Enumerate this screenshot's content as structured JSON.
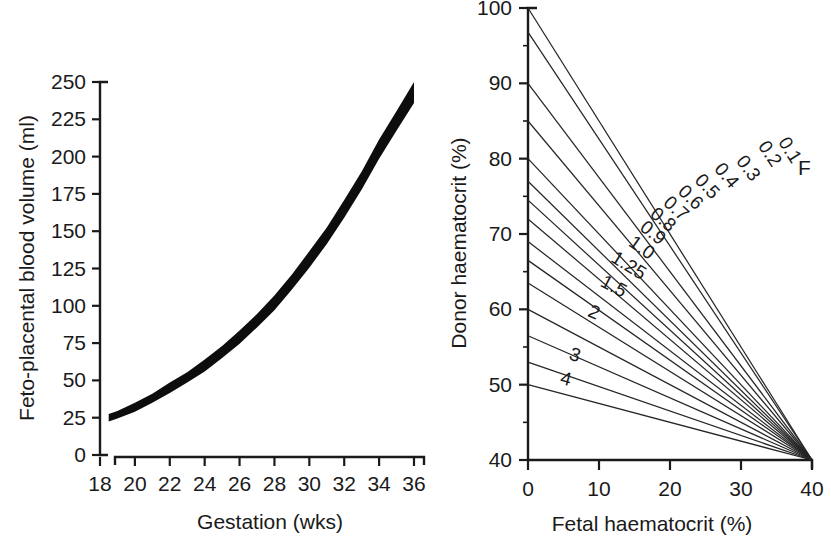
{
  "figure": {
    "background_color": "#ffffff",
    "ink_color": "#1a1a1a",
    "panel_count": 2
  },
  "chart_data": [
    {
      "id": "feto-placental-blood-volume",
      "type": "line",
      "title": "",
      "xlabel": "Gestation (wks)",
      "ylabel": "Feto-placental blood volume (ml)",
      "xlim": [
        18,
        36
      ],
      "ylim": [
        0,
        250
      ],
      "xticks": [
        18,
        20,
        22,
        24,
        26,
        28,
        30,
        32,
        34,
        36
      ],
      "yticks": [
        0,
        25,
        50,
        75,
        100,
        125,
        150,
        175,
        200,
        225,
        250
      ],
      "xtick_labels": [
        "18",
        "20",
        "22",
        "24",
        "26",
        "28",
        "30",
        "32",
        "34",
        "36"
      ],
      "ytick_labels": [
        "0",
        "25",
        "50",
        "75",
        "100",
        "125",
        "150",
        "175",
        "200",
        "225",
        "250"
      ],
      "grid": false,
      "legend": false,
      "series": [
        {
          "name": "Feto-placental blood volume",
          "style": "thick-band",
          "x": [
            18.5,
            19,
            20,
            21,
            22,
            23,
            24,
            25,
            26,
            27,
            28,
            29,
            30,
            31,
            32,
            33,
            34,
            35,
            36
          ],
          "values": [
            25,
            27,
            32,
            38,
            45,
            52,
            60,
            69,
            79,
            90,
            102,
            116,
            131,
            147,
            165,
            184,
            205,
            224,
            243
          ],
          "band_halfwidth": [
            2.5,
            2.5,
            3,
            3,
            3.5,
            3.5,
            4,
            4,
            4.5,
            4.5,
            5,
            5,
            5.5,
            5.5,
            6,
            6,
            6.5,
            6.5,
            7
          ]
        }
      ]
    },
    {
      "id": "donor-fetal-haematocrit-nomogram",
      "type": "line",
      "title": "",
      "xlabel": "Fetal haematocrit (%)",
      "ylabel": "Donor haematocrit (%)",
      "xlim": [
        0,
        40
      ],
      "ylim": [
        40,
        100
      ],
      "xticks": [
        0,
        10,
        20,
        30,
        40
      ],
      "yticks": [
        40,
        50,
        60,
        70,
        80,
        90,
        100
      ],
      "xtick_labels": [
        "0",
        "10",
        "20",
        "30",
        "40"
      ],
      "ytick_labels": [
        "40",
        "50",
        "60",
        "70",
        "80",
        "90",
        "100"
      ],
      "minor_ytick_step": 5,
      "minor_xtick_step": 5,
      "grid": false,
      "legend": false,
      "legend_note": "F",
      "convergence_point": [
        40,
        40
      ],
      "series": [
        {
          "name": "0.1",
          "label": "0.1",
          "y_intercept": 100.0,
          "label_pos": [
            35.8,
            80.5
          ]
        },
        {
          "name": "0.2",
          "label": "0.2",
          "y_intercept": 96.8,
          "label_pos": [
            33.0,
            80.0
          ]
        },
        {
          "name": "0.3",
          "label": "0.3",
          "y_intercept": 90.0,
          "label_pos": [
            30.0,
            78.0
          ]
        },
        {
          "name": "0.4",
          "label": "0.4",
          "y_intercept": 85.0,
          "label_pos": [
            27.0,
            77.0
          ]
        },
        {
          "name": "0.5",
          "label": "0.5",
          "y_intercept": 80.0,
          "label_pos": [
            24.3,
            75.5
          ]
        },
        {
          "name": "0.6",
          "label": "0.6",
          "y_intercept": 77.0,
          "label_pos": [
            22.0,
            74.0
          ]
        },
        {
          "name": "0.7",
          "label": "0.7",
          "y_intercept": 74.5,
          "label_pos": [
            20.0,
            72.5
          ]
        },
        {
          "name": "0.8",
          "label": "0.8",
          "y_intercept": 72.0,
          "label_pos": [
            18.2,
            71.0
          ]
        },
        {
          "name": "0.9",
          "label": "0.9",
          "y_intercept": 69.0,
          "label_pos": [
            16.8,
            69.2
          ]
        },
        {
          "name": "1.0",
          "label": "1.0",
          "y_intercept": 66.5,
          "label_pos": [
            15.3,
            67.2
          ]
        },
        {
          "name": "1.25",
          "label": "1.25",
          "y_intercept": 63.5,
          "label_pos": [
            13.5,
            64.8
          ]
        },
        {
          "name": "1.5",
          "label": "1.5",
          "y_intercept": 60.0,
          "label_pos": [
            11.5,
            62.0
          ]
        },
        {
          "name": "2",
          "label": "2",
          "y_intercept": 56.5,
          "label_pos": [
            8.8,
            58.5
          ]
        },
        {
          "name": "3",
          "label": "3",
          "y_intercept": 53.0,
          "label_pos": [
            6.2,
            52.8
          ]
        },
        {
          "name": "4",
          "label": "4",
          "y_intercept": 50.0,
          "label_pos": [
            5.0,
            49.6
          ]
        }
      ]
    }
  ]
}
